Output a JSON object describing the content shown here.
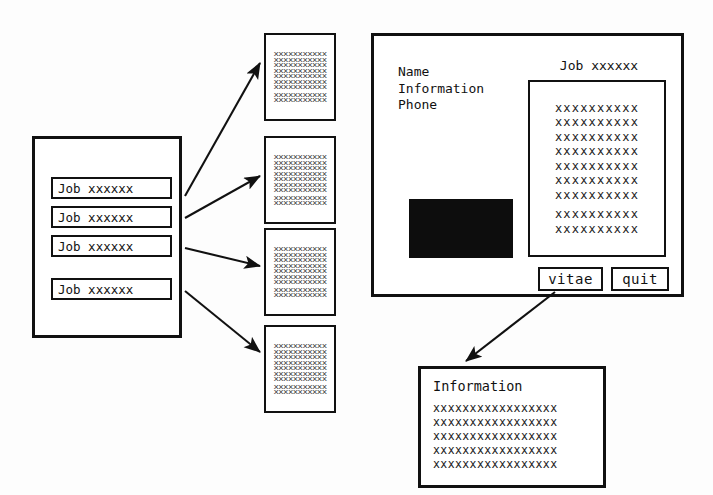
{
  "diagram": {
    "colors": {
      "ink": "#111111",
      "paper": "#ffffff",
      "photo_fill": "#0d0d0d",
      "placeholder_text": "#1a1a1a"
    }
  },
  "job_list": {
    "name": "job-list-panel",
    "rows": [
      {
        "label": "Job xxxxxx"
      },
      {
        "label": "Job xxxxxx"
      },
      {
        "label": "Job xxxxxx"
      },
      {
        "label": "Job xxxxxx"
      }
    ]
  },
  "thumbnails": [
    {
      "name": "document-thumbnail-1",
      "content": "xxxxxxxxxxx\nxxxxxxxxxxx\nxxxxxxxxxxx\nxxxxxxxxxxx\nxxxxxxxxxxx\nxxxxxxxxxxx\nxxxxxxxxxxx",
      "content2": "xxxxxxxxxxx\nxxxxxxxxxxx"
    },
    {
      "name": "document-thumbnail-2",
      "content": "xxxxxxxxxxx\nxxxxxxxxxxx\nxxxxxxxxxxx\nxxxxxxxxxxx\nxxxxxxxxxxx\nxxxxxxxxxxx\nxxxxxxxxxxx",
      "content2": "xxxxxxxxxxx\nxxxxxxxxxxx"
    },
    {
      "name": "document-thumbnail-3",
      "content": "xxxxxxxxxxx\nxxxxxxxxxxx\nxxxxxxxxxxx\nxxxxxxxxxxx\nxxxxxxxxxxx\nxxxxxxxxxxx\nxxxxxxxxxxx",
      "content2": "xxxxxxxxxxx\nxxxxxxxxxxx"
    },
    {
      "name": "document-thumbnail-4",
      "content": "xxxxxxxxxxx\nxxxxxxxxxxx\nxxxxxxxxxxx\nxxxxxxxxxxx\nxxxxxxxxxxx\nxxxxxxxxxxx\nxxxxxxxxxxx",
      "content2": "xxxxxxxxxxx\nxxxxxxxxxxx"
    }
  ],
  "detail_panel": {
    "fields_text": "Name\nInformation\nPhone",
    "fields": [
      "Name",
      "Information",
      "Phone"
    ],
    "photo_label": "photo placeholder",
    "document_title": "Job xxxxxx",
    "document_body": "xxxxxxxxxx\nxxxxxxxxxx\nxxxxxxxxxx\nxxxxxxxxxx\nxxxxxxxxxx\nxxxxxxxxxx\nxxxxxxxxxx",
    "document_body2": "xxxxxxxxxx\nxxxxxxxxxx",
    "buttons": {
      "vitae": "vitae",
      "quit": "quit"
    }
  },
  "information_window": {
    "title": "Information",
    "body": "xxxxxxxxxxxxxxxxx\nxxxxxxxxxxxxxxxxx\nxxxxxxxxxxxxxxxxx\nxxxxxxxxxxxxxxxxx\nxxxxxxxxxxxxxxxxx"
  }
}
